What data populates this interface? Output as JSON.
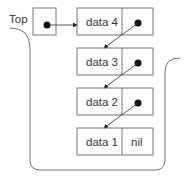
{
  "diagram": {
    "top_label": "Top",
    "nodes": [
      {
        "data": "data 4",
        "next": "pointer"
      },
      {
        "data": "data 3",
        "next": "pointer"
      },
      {
        "data": "data 2",
        "next": "pointer"
      },
      {
        "data": "data 1",
        "next": "nil"
      }
    ],
    "nil_label": "nil",
    "colors": {
      "stroke": "#777777",
      "dot": "#111111",
      "text": "#333333"
    }
  }
}
